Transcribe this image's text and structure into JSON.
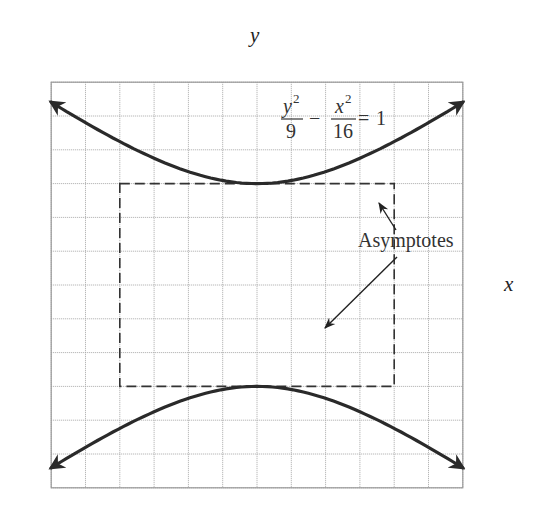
{
  "chart_data": {
    "type": "line",
    "title": "",
    "equation": {
      "num1": "y",
      "exp1": "2",
      "den1": "9",
      "minus": "−",
      "num2": "x",
      "exp2": "2",
      "den2": "16",
      "equals": "=",
      "rhs": "1"
    },
    "xlabel": "x",
    "ylabel": "y",
    "xlim": [
      -6,
      6
    ],
    "ylim": [
      -6,
      6
    ],
    "grid": true,
    "x_ticks": [
      {
        "value": -5,
        "label": "−5"
      },
      {
        "value": -4,
        "label": "−4"
      },
      {
        "value": -3,
        "label": "−3"
      },
      {
        "value": -2,
        "label": "−2"
      },
      {
        "value": -1,
        "label": "−1"
      },
      {
        "value": 1,
        "label": "1"
      },
      {
        "value": 2,
        "label": "2"
      },
      {
        "value": 3,
        "label": "3"
      },
      {
        "value": 4,
        "label": "4"
      },
      {
        "value": 5,
        "label": "5"
      }
    ],
    "y_ticks": [
      {
        "value": 5,
        "label": "5"
      },
      {
        "value": 4,
        "label": "4"
      },
      {
        "value": 3,
        "label": "3"
      },
      {
        "value": 2,
        "label": "2"
      },
      {
        "value": 1,
        "label": "1"
      },
      {
        "value": -1,
        "label": "−1"
      },
      {
        "value": -2,
        "label": "−2"
      },
      {
        "value": -3,
        "label": "−3"
      },
      {
        "value": -4,
        "label": "−4"
      },
      {
        "value": -5,
        "label": "−5"
      }
    ],
    "series": [
      {
        "name": "upper branch",
        "style": "solid",
        "function": "y = 3*sqrt(1 + x^2/16)",
        "x_range": [
          -6,
          6
        ],
        "arrows": true
      },
      {
        "name": "lower branch",
        "style": "solid",
        "function": "y = -3*sqrt(1 + x^2/16)",
        "x_range": [
          -6,
          6
        ],
        "arrows": true
      },
      {
        "name": "asymptote",
        "style": "dashed",
        "function": "y = 3/4 x",
        "x_range": [
          -6,
          6
        ]
      },
      {
        "name": "asymptote",
        "style": "dashed",
        "function": "y = -3/4 x",
        "x_range": [
          -6,
          6
        ]
      }
    ],
    "fundamental_rectangle": {
      "x": [
        -4,
        4
      ],
      "y": [
        -3,
        3
      ],
      "style": "dashed"
    },
    "points": [
      {
        "x": 0,
        "y": 3,
        "label": "vertex"
      },
      {
        "x": 0,
        "y": -3,
        "label": "vertex"
      },
      {
        "x": -4,
        "y": 0
      },
      {
        "x": 4,
        "y": 0
      }
    ],
    "annotations": [
      {
        "text": "Asymptotes",
        "x": 3.0,
        "y": 1.1,
        "pointers_to": [
          [
            3.7,
            2.4
          ],
          [
            2.0,
            -1.25
          ]
        ]
      }
    ]
  }
}
